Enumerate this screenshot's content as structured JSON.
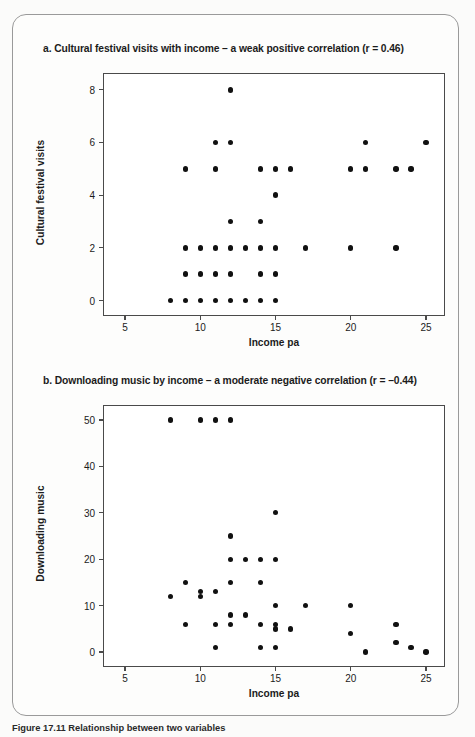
{
  "figure": {
    "caption": "Figure 17.11  Relationship between two variables"
  },
  "panel_a": {
    "title": "a. Cultural festival visits with income – a weak positive correlation (r = 0.46)"
  },
  "panel_b": {
    "title": "b. Downloading music by income – a moderate negative correlation (r = –0.44)"
  },
  "chart_data": [
    {
      "type": "scatter",
      "title": "a. Cultural festival visits with income – a weak positive correlation (r = 0.46)",
      "xlabel": "Income pa",
      "ylabel": "Cultural festival visits",
      "xlim": [
        3.6,
        26.2
      ],
      "ylim": [
        -0.55,
        8.6
      ],
      "xticks": [
        5,
        10,
        15,
        20,
        25
      ],
      "yticks": [
        0,
        2,
        4,
        6,
        8
      ],
      "grid": false,
      "legend": null,
      "correlation_r": 0.46,
      "points": [
        {
          "x": 12,
          "y": 8
        },
        {
          "x": 11,
          "y": 6
        },
        {
          "x": 12,
          "y": 6
        },
        {
          "x": 21,
          "y": 6
        },
        {
          "x": 25,
          "y": 6
        },
        {
          "x": 9,
          "y": 5
        },
        {
          "x": 11,
          "y": 5
        },
        {
          "x": 14,
          "y": 5
        },
        {
          "x": 15,
          "y": 5
        },
        {
          "x": 16,
          "y": 5
        },
        {
          "x": 20,
          "y": 5
        },
        {
          "x": 21,
          "y": 5
        },
        {
          "x": 23,
          "y": 5
        },
        {
          "x": 24,
          "y": 5
        },
        {
          "x": 15,
          "y": 4
        },
        {
          "x": 12,
          "y": 3
        },
        {
          "x": 14,
          "y": 3
        },
        {
          "x": 9,
          "y": 2
        },
        {
          "x": 10,
          "y": 2
        },
        {
          "x": 11,
          "y": 2
        },
        {
          "x": 12,
          "y": 2
        },
        {
          "x": 13,
          "y": 2
        },
        {
          "x": 14,
          "y": 2
        },
        {
          "x": 15,
          "y": 2
        },
        {
          "x": 17,
          "y": 2
        },
        {
          "x": 20,
          "y": 2
        },
        {
          "x": 23,
          "y": 2
        },
        {
          "x": 9,
          "y": 1
        },
        {
          "x": 10,
          "y": 1
        },
        {
          "x": 11,
          "y": 1
        },
        {
          "x": 12,
          "y": 1
        },
        {
          "x": 14,
          "y": 1
        },
        {
          "x": 15,
          "y": 1
        },
        {
          "x": 8,
          "y": 0
        },
        {
          "x": 9,
          "y": 0
        },
        {
          "x": 10,
          "y": 0
        },
        {
          "x": 11,
          "y": 0
        },
        {
          "x": 12,
          "y": 0
        },
        {
          "x": 13,
          "y": 0
        },
        {
          "x": 14,
          "y": 0
        },
        {
          "x": 15,
          "y": 0
        }
      ]
    },
    {
      "type": "scatter",
      "title": "b. Downloading music by income – a moderate negative correlation (r = –0.44)",
      "xlabel": "Income pa",
      "ylabel": "Downloading music",
      "xlim": [
        3.6,
        26.2
      ],
      "ylim": [
        -3.0,
        53.0
      ],
      "xticks": [
        5,
        10,
        15,
        20,
        25
      ],
      "yticks": [
        0,
        10,
        20,
        30,
        40,
        50
      ],
      "grid": false,
      "legend": null,
      "correlation_r": -0.44,
      "points": [
        {
          "x": 8,
          "y": 50
        },
        {
          "x": 10,
          "y": 50
        },
        {
          "x": 11,
          "y": 50
        },
        {
          "x": 12,
          "y": 50
        },
        {
          "x": 15,
          "y": 30
        },
        {
          "x": 12,
          "y": 25
        },
        {
          "x": 12,
          "y": 20
        },
        {
          "x": 13,
          "y": 20
        },
        {
          "x": 14,
          "y": 20
        },
        {
          "x": 15,
          "y": 20
        },
        {
          "x": 9,
          "y": 15
        },
        {
          "x": 12,
          "y": 15
        },
        {
          "x": 14,
          "y": 15
        },
        {
          "x": 10,
          "y": 13
        },
        {
          "x": 11,
          "y": 13
        },
        {
          "x": 8,
          "y": 12
        },
        {
          "x": 10,
          "y": 12
        },
        {
          "x": 15,
          "y": 10
        },
        {
          "x": 17,
          "y": 10
        },
        {
          "x": 20,
          "y": 10
        },
        {
          "x": 12,
          "y": 8
        },
        {
          "x": 13,
          "y": 8
        },
        {
          "x": 9,
          "y": 6
        },
        {
          "x": 11,
          "y": 6
        },
        {
          "x": 12,
          "y": 6
        },
        {
          "x": 14,
          "y": 6
        },
        {
          "x": 15,
          "y": 6
        },
        {
          "x": 23,
          "y": 6
        },
        {
          "x": 15,
          "y": 5
        },
        {
          "x": 16,
          "y": 5
        },
        {
          "x": 20,
          "y": 4
        },
        {
          "x": 11,
          "y": 1
        },
        {
          "x": 14,
          "y": 1
        },
        {
          "x": 15,
          "y": 1
        },
        {
          "x": 23,
          "y": 2
        },
        {
          "x": 24,
          "y": 1
        },
        {
          "x": 21,
          "y": 0
        },
        {
          "x": 25,
          "y": 0
        }
      ]
    }
  ]
}
